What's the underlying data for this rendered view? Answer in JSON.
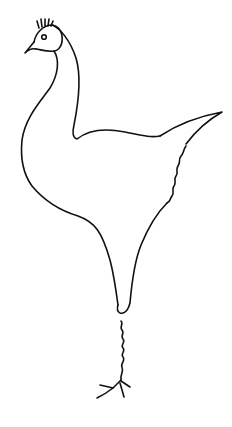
{
  "image": {
    "subject": "line drawing of a bird",
    "background_color": "#ffffff",
    "stroke_color": "#111111"
  },
  "parts": [
    {
      "name": "crest"
    },
    {
      "name": "head"
    },
    {
      "name": "eye"
    },
    {
      "name": "beak"
    },
    {
      "name": "neck"
    },
    {
      "name": "body"
    },
    {
      "name": "tail"
    },
    {
      "name": "leg"
    },
    {
      "name": "foot"
    }
  ]
}
